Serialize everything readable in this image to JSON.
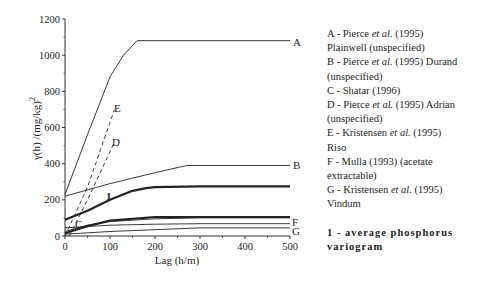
{
  "chart_data": {
    "type": "line",
    "title": "",
    "xlabel": "Lag (h/m)",
    "ylabel": "γ(h) /(mg/kg)²",
    "xlim": [
      0,
      500
    ],
    "ylim": [
      0,
      1200
    ],
    "xticks": [
      0,
      100,
      200,
      300,
      400,
      500
    ],
    "yticks": [
      0,
      200,
      400,
      600,
      800,
      1000,
      1200
    ],
    "grid": false,
    "legend_position": "right",
    "series": [
      {
        "name": "A",
        "label": "A - Pierce et al. (1995) Plainwell (unspecified)",
        "style": "solid",
        "x": [
          0,
          50,
          100,
          130,
          160,
          200,
          300,
          400,
          500
        ],
        "y": [
          230,
          560,
          880,
          1000,
          1080,
          1080,
          1080,
          1080,
          1080
        ]
      },
      {
        "name": "B",
        "label": "B - Pierce et al. (1995) Durand (unspecified)",
        "style": "solid",
        "x": [
          0,
          100,
          200,
          270,
          300,
          400,
          500
        ],
        "y": [
          220,
          290,
          350,
          390,
          390,
          390,
          390
        ]
      },
      {
        "name": "C",
        "label": "C - Shatar (1996)",
        "style": "solid",
        "x": [
          0,
          50,
          100,
          200,
          300,
          400,
          500
        ],
        "y": [
          25,
          60,
          80,
          95,
          100,
          100,
          100
        ]
      },
      {
        "name": "D",
        "label": "D - Pierce et al. (1995) Adrian (unspecified)",
        "style": "dashed",
        "x": [
          10,
          50,
          110
        ],
        "y": [
          0,
          200,
          520
        ]
      },
      {
        "name": "E",
        "label": "E - Kristensen et al. (1995) Riso",
        "style": "dashed",
        "x": [
          0,
          50,
          110
        ],
        "y": [
          0,
          270,
          700
        ]
      },
      {
        "name": "F",
        "label": "F - Mulla (1993) (acetate extractable)",
        "style": "solid",
        "x": [
          0,
          100,
          200,
          300,
          400,
          500
        ],
        "y": [
          45,
          60,
          65,
          68,
          68,
          68
        ]
      },
      {
        "name": "G",
        "label": "G - Kristensen et al. (1995) Vindum",
        "style": "solid",
        "x": [
          0,
          100,
          200,
          300,
          400,
          500
        ],
        "y": [
          10,
          25,
          35,
          45,
          45,
          45
        ]
      },
      {
        "name": "1",
        "label": "1 - average phosphorus variogram",
        "style": "bold",
        "x": [
          0,
          50,
          100,
          150,
          180,
          200,
          300,
          400,
          500
        ],
        "y": [
          90,
          140,
          200,
          250,
          265,
          270,
          275,
          275,
          275
        ]
      },
      {
        "name": "C-lower",
        "label": "",
        "style": "bold",
        "x": [
          0,
          50,
          100,
          200,
          300,
          400,
          500
        ],
        "y": [
          15,
          55,
          85,
          105,
          105,
          105,
          105
        ]
      }
    ]
  },
  "axes": {
    "xlabel": "Lag (h/m)",
    "ylabel": "γ(h) /(mg/kg)",
    "ylabel_sup": "2",
    "xticks": [
      "0",
      "100",
      "200",
      "300",
      "400",
      "500"
    ],
    "yticks": [
      "0",
      "200",
      "400",
      "600",
      "800",
      "1000",
      "1200"
    ]
  },
  "curve_labels": {
    "A": "A",
    "B": "B",
    "C": "C",
    "D": "D",
    "E": "E",
    "F": "F",
    "G": "G",
    "one": "1"
  },
  "legend": {
    "lines": [
      {
        "prefix": "A - Pierce ",
        "em": "et al.",
        "suffix": " (1995)"
      },
      {
        "prefix": "Plainwell (unspecified)",
        "em": "",
        "suffix": ""
      },
      {
        "prefix": "B - Pierce ",
        "em": "et al.",
        "suffix": " (1995) Durand"
      },
      {
        "prefix": "(unspecified)",
        "em": "",
        "suffix": ""
      },
      {
        "prefix": "C - Shatar (1996)",
        "em": "",
        "suffix": ""
      },
      {
        "prefix": "D - Pierce ",
        "em": "et al.",
        "suffix": " (1995) Adrian"
      },
      {
        "prefix": "(unspecified)",
        "em": "",
        "suffix": ""
      },
      {
        "prefix": "E - Kristensen ",
        "em": "et al.",
        "suffix": " (1995)"
      },
      {
        "prefix": "Riso",
        "em": "",
        "suffix": ""
      },
      {
        "prefix": "F - Mulla (1993) (acetate",
        "em": "",
        "suffix": ""
      },
      {
        "prefix": "extractable)",
        "em": "",
        "suffix": ""
      },
      {
        "prefix": "G - Kristensen ",
        "em": "et al.",
        "suffix": " (1995)"
      },
      {
        "prefix": "Vindum",
        "em": "",
        "suffix": ""
      }
    ],
    "bold_line1": "1 - average phosphorus",
    "bold_line2": "variogram"
  }
}
